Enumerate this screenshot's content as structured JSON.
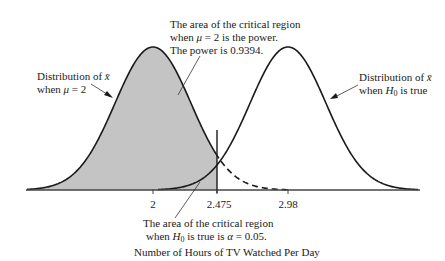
{
  "chart_data": {
    "type": "area",
    "title": "",
    "xlabel": "Number of Hours of TV Watched Per Day",
    "ylabel": "",
    "x_ticks": [
      "2",
      "2.475",
      "2.98"
    ],
    "series": [
      {
        "name": "Distribution of x̄ when μ = 2",
        "mean": 2,
        "style": "solid",
        "shaded_region": "x < 2.475"
      },
      {
        "name": "Distribution of x̄ when H0 is true",
        "mean": 2.98,
        "style": "solid with dashed left tail",
        "left_tail": "x < 2.475 (alpha region)"
      }
    ],
    "critical_value": 2.475,
    "power": 0.9394,
    "alpha": 0.05,
    "grid": false,
    "legend": "none (annotations instead)"
  },
  "annotations": {
    "power_line1": "The area of the critical region",
    "power_line2_pre": "when ",
    "power_line2_mu": "μ",
    "power_line2_post": " = 2 is the power.",
    "power_line3": "The power is 0.9394.",
    "left_dist_line1_pre": "Distribution of ",
    "left_dist_xbar": "x̄",
    "left_dist_line2_pre": "when ",
    "left_dist_mu": "μ",
    "left_dist_line2_post": " = 2",
    "right_dist_line1_pre": "Distribution of ",
    "right_dist_xbar": "x̄",
    "right_dist_line2_pre": "when ",
    "right_dist_H": "H",
    "right_dist_sub": "0",
    "right_dist_line2_post": " is true",
    "alpha_line1": "The area of the critical region",
    "alpha_line2_pre": "when ",
    "alpha_H": "H",
    "alpha_sub": "0",
    "alpha_line2_mid": " is true is ",
    "alpha_sym": "α",
    "alpha_line2_post": " = 0.05."
  },
  "axis": {
    "tick_2": "2",
    "tick_2475": "2.475",
    "tick_298": "2.98",
    "xlabel": "Number of Hours of TV Watched Per Day"
  },
  "colors": {
    "shade": "#c4c4c4",
    "curve": "#1a1a1a",
    "axis": "#555555"
  }
}
